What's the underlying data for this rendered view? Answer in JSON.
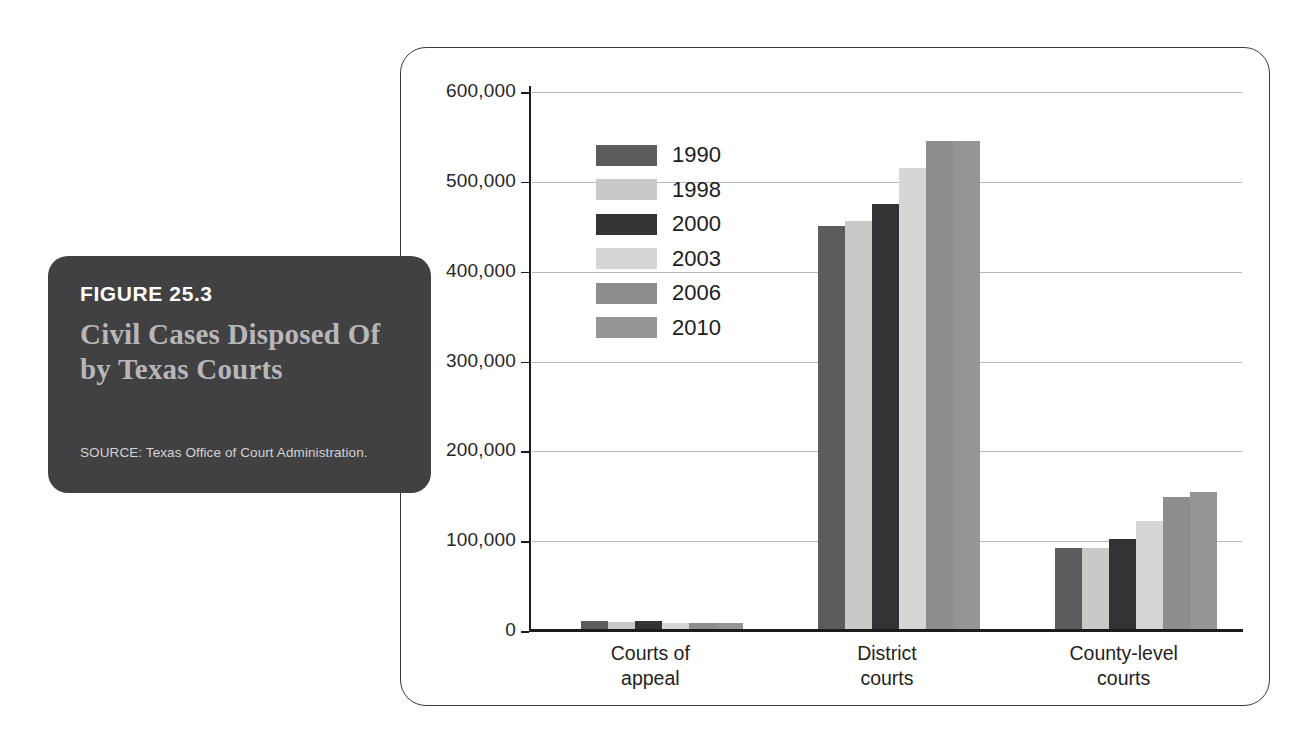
{
  "figure": {
    "number_label": "FIGURE 25.3",
    "title": "Civil Cases\nDisposed Of by\nTexas Courts",
    "source": "SOURCE: Texas Office of Court Administration.",
    "card_color": "#414042",
    "title_color": "#b7b7b9",
    "number_color": "#ffffff"
  },
  "chart_data": {
    "type": "bar",
    "title": "Civil Cases Disposed Of by Texas Courts",
    "subtitle": "",
    "xlabel": "",
    "ylabel": "",
    "grid": true,
    "legend_position": "inside-upper-left",
    "ylim": [
      0,
      600000
    ],
    "ytick_values": [
      0,
      100000,
      200000,
      300000,
      400000,
      500000,
      600000
    ],
    "ytick_labels": [
      "0",
      "100,000",
      "200,000",
      "300,000",
      "400,000",
      "500,000",
      "600,000"
    ],
    "categories": [
      "Courts of\nappeal",
      "District\ncourts",
      "County-level\ncourts"
    ],
    "category_labels_flat": [
      "Courts of appeal",
      "District courts",
      "County-level courts"
    ],
    "series": [
      {
        "name": "1990",
        "color": "#5c5c5e",
        "values": [
          11000,
          451000,
          92000
        ]
      },
      {
        "name": "1998",
        "color": "#c9c9c7",
        "values": [
          10000,
          456000,
          92500
        ]
      },
      {
        "name": "2000",
        "color": "#333335",
        "values": [
          11000,
          475000,
          102000
        ]
      },
      {
        "name": "2003",
        "color": "#d6d6d4",
        "values": [
          9000,
          515000,
          122000
        ]
      },
      {
        "name": "2006",
        "color": "#8d8d8d",
        "values": [
          9000,
          545000,
          149000
        ]
      },
      {
        "name": "2010",
        "color": "#959595",
        "values": [
          9000,
          545000,
          155000
        ]
      }
    ],
    "annotations": []
  },
  "frame": {
    "border_color": "#3a3a3a",
    "background": "#ffffff"
  }
}
